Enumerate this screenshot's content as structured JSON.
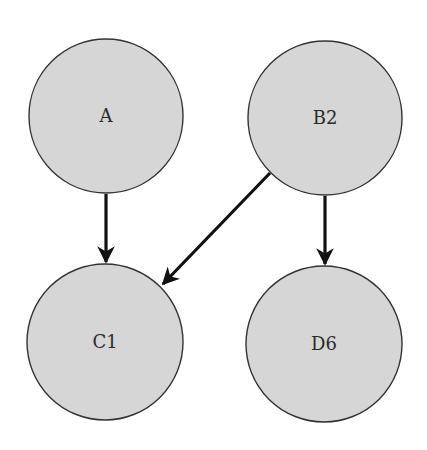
{
  "diagram": {
    "type": "directed-graph",
    "node_fill": "#d6d6d6",
    "node_stroke": "#333333",
    "edge_color": "#111111",
    "nodes": [
      {
        "id": "A",
        "label": "A",
        "cx": 106,
        "cy": 116,
        "r": 77
      },
      {
        "id": "B2",
        "label": "B2",
        "cx": 325,
        "cy": 118,
        "r": 77
      },
      {
        "id": "C1",
        "label": "C1",
        "cx": 105,
        "cy": 342,
        "r": 78
      },
      {
        "id": "D6",
        "label": "D6",
        "cx": 324,
        "cy": 344,
        "r": 78
      }
    ],
    "edges": [
      {
        "from": "A",
        "to": "C1"
      },
      {
        "from": "B2",
        "to": "C1"
      },
      {
        "from": "B2",
        "to": "D6"
      }
    ]
  }
}
